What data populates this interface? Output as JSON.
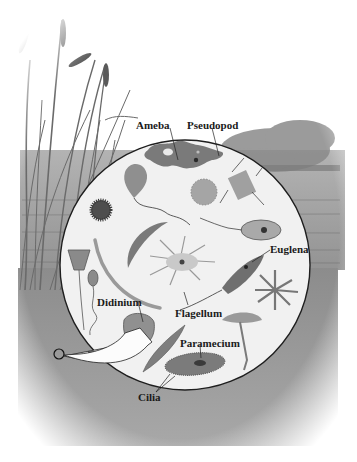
{
  "figure": {
    "type": "pond-microorganisms-illustration",
    "magnifier": {
      "shape": "circle",
      "cx": 185,
      "cy": 265,
      "r": 125
    },
    "labels": [
      {
        "id": "ameba",
        "text": "Ameba",
        "x": 136,
        "y": 122
      },
      {
        "id": "pseudopod",
        "text": "Pseudopod",
        "x": 187,
        "y": 122
      },
      {
        "id": "euglena",
        "text": "Euglena",
        "x": 270,
        "y": 247
      },
      {
        "id": "didinium",
        "text": "Didinium",
        "x": 97,
        "y": 299
      },
      {
        "id": "flagellum",
        "text": "Flagellum",
        "x": 175,
        "y": 309
      },
      {
        "id": "paramecium",
        "text": "Paramecium",
        "x": 180,
        "y": 339
      },
      {
        "id": "cilia",
        "text": "Cilia",
        "x": 138,
        "y": 394
      }
    ]
  }
}
